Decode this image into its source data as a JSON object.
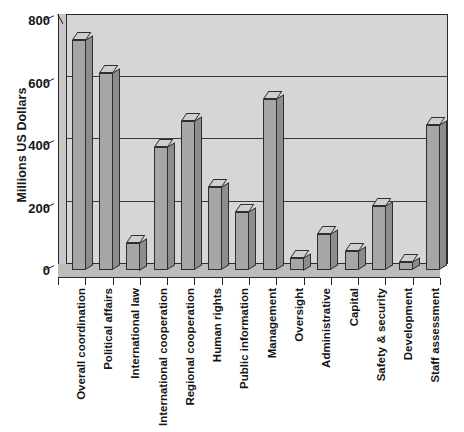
{
  "chart_data": {
    "type": "bar",
    "title": "",
    "subtitle": "",
    "xlabel": "",
    "ylabel": "Millions US Dollars",
    "ylim": [
      0,
      800
    ],
    "ytick_values": [
      0,
      200,
      400,
      600,
      800
    ],
    "ytick_labels": [
      "0",
      "200",
      "400",
      "600",
      "800"
    ],
    "grid": true,
    "gridlines_at": [
      200,
      400,
      600
    ],
    "legend": null,
    "legend_position": "none",
    "style": "3d-bar",
    "categories": [
      "Overall coordination",
      "Political affairs",
      "International law",
      "International cooperation",
      "Regional cooperation",
      "Human rights",
      "Public information",
      "Management",
      "Oversight",
      "Administrative",
      "Capital",
      "Safety & security",
      "Development",
      "Staff assessment"
    ],
    "values": [
      735,
      630,
      88,
      395,
      477,
      265,
      186,
      547,
      40,
      115,
      62,
      205,
      25,
      465
    ],
    "series": [
      {
        "name": "Budget",
        "values": [
          735,
          630,
          88,
          395,
          477,
          265,
          186,
          547,
          40,
          115,
          62,
          205,
          25,
          465
        ]
      }
    ]
  },
  "colors": {
    "bar_face": "#a6a6a6",
    "bar_top": "#cfcfcf",
    "bar_side": "#8d8d8d",
    "plot_background": "#d6d6d6",
    "floor": "#bcbcbc",
    "axis_line": "#2b2b2b",
    "gridline": "#3a3a3a",
    "text": "#151515",
    "page_background": "#ffffff"
  }
}
